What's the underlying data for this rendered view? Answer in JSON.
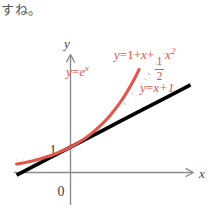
{
  "caption": {
    "text": "すね。"
  },
  "figure": {
    "background_color": "#ffffff",
    "axis_color": "#8a8c90",
    "accent_color": "#e3564c",
    "curve_color": "#000000",
    "x_axis_label": "x",
    "y_axis_label": "y",
    "origin_label": "0",
    "y_tick_label": "1"
  },
  "labels": {
    "exp": {
      "y": "y",
      "eq": "=",
      "base": "e",
      "exponent": "x"
    },
    "linear": {
      "y": "y",
      "eq": "=",
      "rhs": "x+1"
    },
    "quadratic": {
      "y": "y",
      "eq": "=",
      "lead": "1+",
      "x_term": "x",
      "plus": "+",
      "frac_numerator": "1",
      "frac_denominator": "2",
      "tail_base": "x",
      "tail_exponent": "2"
    }
  },
  "chart_data": {
    "type": "line",
    "title": "",
    "xlabel": "x",
    "ylabel": "y",
    "xlim": [
      -1.1,
      3.2
    ],
    "ylim": [
      -0.9,
      5.2
    ],
    "grid": false,
    "legend": "inline-annotations",
    "axis_ticks": {
      "x": [
        0
      ],
      "y": [
        1
      ]
    },
    "series": [
      {
        "name": "y=e^x",
        "color": "#e3564c",
        "style": "solid",
        "formula": "e^x",
        "x": [
          -1.1,
          -0.9,
          -0.7,
          -0.5,
          -0.3,
          -0.1,
          0.0,
          0.2,
          0.4,
          0.6,
          0.8,
          1.0,
          1.15,
          1.3,
          1.4
        ],
        "y": [
          0.333,
          0.407,
          0.497,
          0.607,
          0.741,
          0.905,
          1.0,
          1.221,
          1.492,
          1.822,
          2.226,
          2.718,
          3.158,
          3.669,
          4.055
        ]
      },
      {
        "name": "y=1+x+(1/2)x^2",
        "color": "#000000",
        "style": "dotted",
        "formula": "1+x+0.5x^2",
        "x": [
          -1.1,
          -0.9,
          -0.7,
          -0.5,
          -0.3,
          -0.1,
          0.0,
          0.3,
          0.6,
          0.9,
          1.2,
          1.5,
          1.75,
          1.95
        ],
        "y": [
          0.505,
          0.505,
          0.545,
          0.625,
          0.745,
          0.905,
          1.0,
          1.345,
          1.78,
          2.305,
          2.92,
          3.625,
          4.281,
          4.851
        ]
      },
      {
        "name": "y=x+1",
        "color": "#000000",
        "style": "solid",
        "formula": "x+1",
        "x": [
          -1.1,
          0.0,
          1.0,
          2.0,
          2.45
        ],
        "y": [
          -0.1,
          1.0,
          2.0,
          3.0,
          3.45
        ]
      }
    ]
  }
}
